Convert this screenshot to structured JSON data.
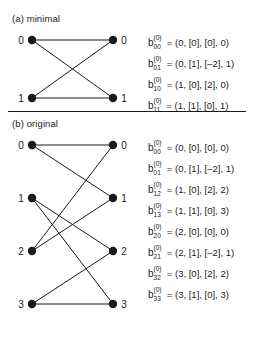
{
  "figure": {
    "panels": [
      {
        "id": "a",
        "title": "(a) minimal",
        "graph": {
          "left_nodes": [
            "0",
            "1"
          ],
          "right_nodes": [
            "0",
            "1"
          ],
          "edges": [
            [
              0,
              0
            ],
            [
              0,
              1
            ],
            [
              1,
              0
            ],
            [
              1,
              1
            ]
          ]
        },
        "equations": [
          {
            "base": "b",
            "sub": "00",
            "sup": "(0)",
            "rest": "= (0, [0], [0], 0)"
          },
          {
            "base": "b",
            "sub": "01",
            "sup": "(0)",
            "rest": "= (0, [1], [–2], 1)"
          },
          {
            "base": "b",
            "sub": "10",
            "sup": "(0)",
            "rest": "= (1, [0], [2], 0)"
          },
          {
            "base": "b",
            "sub": "11",
            "sup": "(0)",
            "rest": "= (1, [1], [0], 1)"
          }
        ]
      },
      {
        "id": "b",
        "title": "(b) original",
        "graph": {
          "left_nodes": [
            "0",
            "1",
            "2",
            "3"
          ],
          "right_nodes": [
            "0",
            "1",
            "2",
            "3"
          ],
          "edges": [
            [
              0,
              0
            ],
            [
              0,
              1
            ],
            [
              1,
              2
            ],
            [
              1,
              3
            ],
            [
              2,
              0
            ],
            [
              2,
              1
            ],
            [
              3,
              2
            ],
            [
              3,
              3
            ]
          ]
        },
        "equations": [
          {
            "base": "b",
            "sub": "00",
            "sup": "(0)",
            "rest": "= (0, [0], [0], 0)"
          },
          {
            "base": "b",
            "sub": "01",
            "sup": "(0)",
            "rest": "= (0, [1], [–2], 1)"
          },
          {
            "base": "b",
            "sub": "12",
            "sup": "(0)",
            "rest": "= (1, [0], [2], 2)"
          },
          {
            "base": "b",
            "sub": "13",
            "sup": "(0)",
            "rest": "= (1, [1], [0], 3)"
          },
          {
            "base": "b",
            "sub": "20",
            "sup": "(0)",
            "rest": "= (2, [0], [0], 0)"
          },
          {
            "base": "b",
            "sub": "21",
            "sup": "(0)",
            "rest": "= (2, [1], [–2], 1)"
          },
          {
            "base": "b",
            "sub": "32",
            "sup": "(0)",
            "rest": "= (3, [0], [2], 2)"
          },
          {
            "base": "b",
            "sub": "33",
            "sup": "(0)",
            "rest": "= (3, [1], [0], 3)"
          }
        ]
      }
    ],
    "colors": {
      "ink": "#1a1a1a",
      "background": "#ffffff"
    }
  }
}
